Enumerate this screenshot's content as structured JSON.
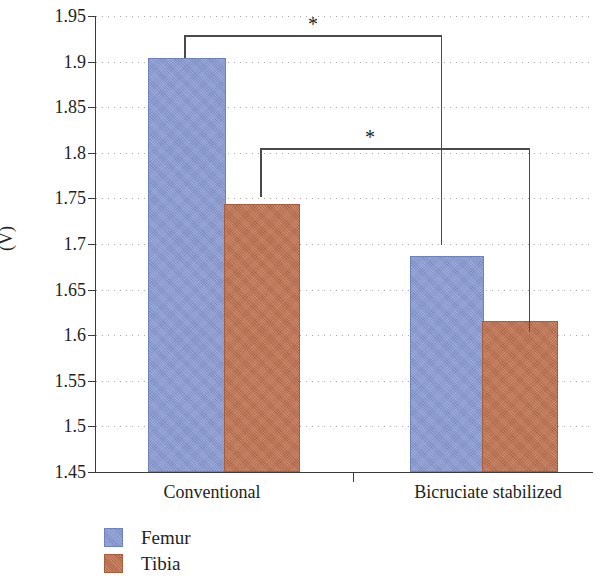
{
  "chart_data": {
    "type": "bar",
    "title": "",
    "xlabel": "",
    "ylabel": "(V)",
    "categories": [
      "Conventional",
      "Bicruciate stabilized"
    ],
    "series": [
      {
        "name": "Femur",
        "color": "#8a9bd4",
        "values": [
          1.902,
          1.685
        ]
      },
      {
        "name": "Tibia",
        "color": "#c0714f",
        "values": [
          1.742,
          1.613
        ]
      }
    ],
    "ylim": [
      1.45,
      1.95
    ],
    "ytick_step": 0.05,
    "ytick_labels": [
      "1.95",
      "1.9",
      "1.85",
      "1.8",
      "1.75",
      "1.7",
      "1.65",
      "1.6",
      "1.55",
      "1.5",
      "1.45"
    ],
    "ytick_values": [
      1.95,
      1.9,
      1.85,
      1.8,
      1.75,
      1.7,
      1.65,
      1.6,
      1.55,
      1.5,
      1.45
    ],
    "grid": true,
    "grid_style": "dotted",
    "legend_position": "bottom-left",
    "annotations": [
      {
        "id": "significance-femur",
        "label": "*",
        "from_series": "Femur",
        "from_category": "Conventional",
        "to_series": "Femur",
        "to_category": "Bicruciate stabilized"
      },
      {
        "id": "significance-tibia",
        "label": "*",
        "from_series": "Tibia",
        "from_category": "Conventional",
        "to_series": "Tibia",
        "to_category": "Bicruciate stabilized"
      }
    ]
  },
  "axis": {
    "y_title": "(V)",
    "ticks": {
      "t0": "1.95",
      "t1": "1.9",
      "t2": "1.85",
      "t3": "1.8",
      "t4": "1.75",
      "t5": "1.7",
      "t6": "1.65",
      "t7": "1.6",
      "t8": "1.55",
      "t9": "1.5",
      "t10": "1.45"
    }
  },
  "categories": {
    "c0": "Conventional",
    "c1": "Bicruciate stabilized"
  },
  "legend": {
    "items": [
      {
        "label": "Femur"
      },
      {
        "label": "Tibia"
      }
    ]
  },
  "significance": {
    "upper_star": "*",
    "lower_star": "*"
  }
}
